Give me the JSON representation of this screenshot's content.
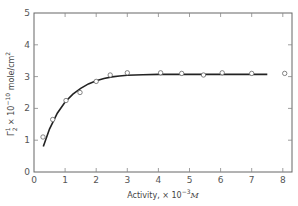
{
  "chart_data": {
    "type": "scatter",
    "title": "",
    "xlabel": "Activity, × 10⁻³M",
    "xlabel_parts": {
      "base": "Activity, × 10",
      "sup": "−3",
      "unit": "M"
    },
    "ylabel": "Γ₂¹ × 10⁻¹⁰ mole/cm²",
    "ylabel_parts": {
      "sym": "Γ",
      "sub": "2",
      "sup1": "1",
      "mid": " × 10",
      "sup2": "−10",
      "unit": " mole/cm",
      "sup3": "2"
    },
    "xlim": [
      0,
      8.3
    ],
    "ylim": [
      0,
      5
    ],
    "xticks": [
      0,
      1,
      2,
      3,
      4,
      5,
      6,
      7,
      8
    ],
    "yticks": [
      0,
      1,
      2,
      3,
      4,
      5
    ],
    "grid": false,
    "legend": null,
    "series": [
      {
        "name": "measured",
        "style": "open-circle",
        "x": [
          0.29,
          0.6,
          1.03,
          1.48,
          2.0,
          2.45,
          3.0,
          4.07,
          4.75,
          5.45,
          6.05,
          7.0,
          8.06
        ],
        "y": [
          1.1,
          1.65,
          2.25,
          2.5,
          2.85,
          3.05,
          3.12,
          3.12,
          3.1,
          3.05,
          3.12,
          3.1,
          3.1
        ]
      },
      {
        "name": "fit",
        "style": "solid-line",
        "x": [
          0.3,
          0.5,
          0.75,
          1.0,
          1.25,
          1.5,
          1.75,
          2.0,
          2.25,
          2.5,
          2.75,
          3.0,
          3.5,
          4.0,
          5.0,
          6.0,
          7.0,
          7.5
        ],
        "y": [
          0.8,
          1.35,
          1.85,
          2.2,
          2.45,
          2.63,
          2.77,
          2.87,
          2.94,
          2.99,
          3.02,
          3.04,
          3.06,
          3.07,
          3.07,
          3.07,
          3.07,
          3.07
        ]
      }
    ]
  }
}
